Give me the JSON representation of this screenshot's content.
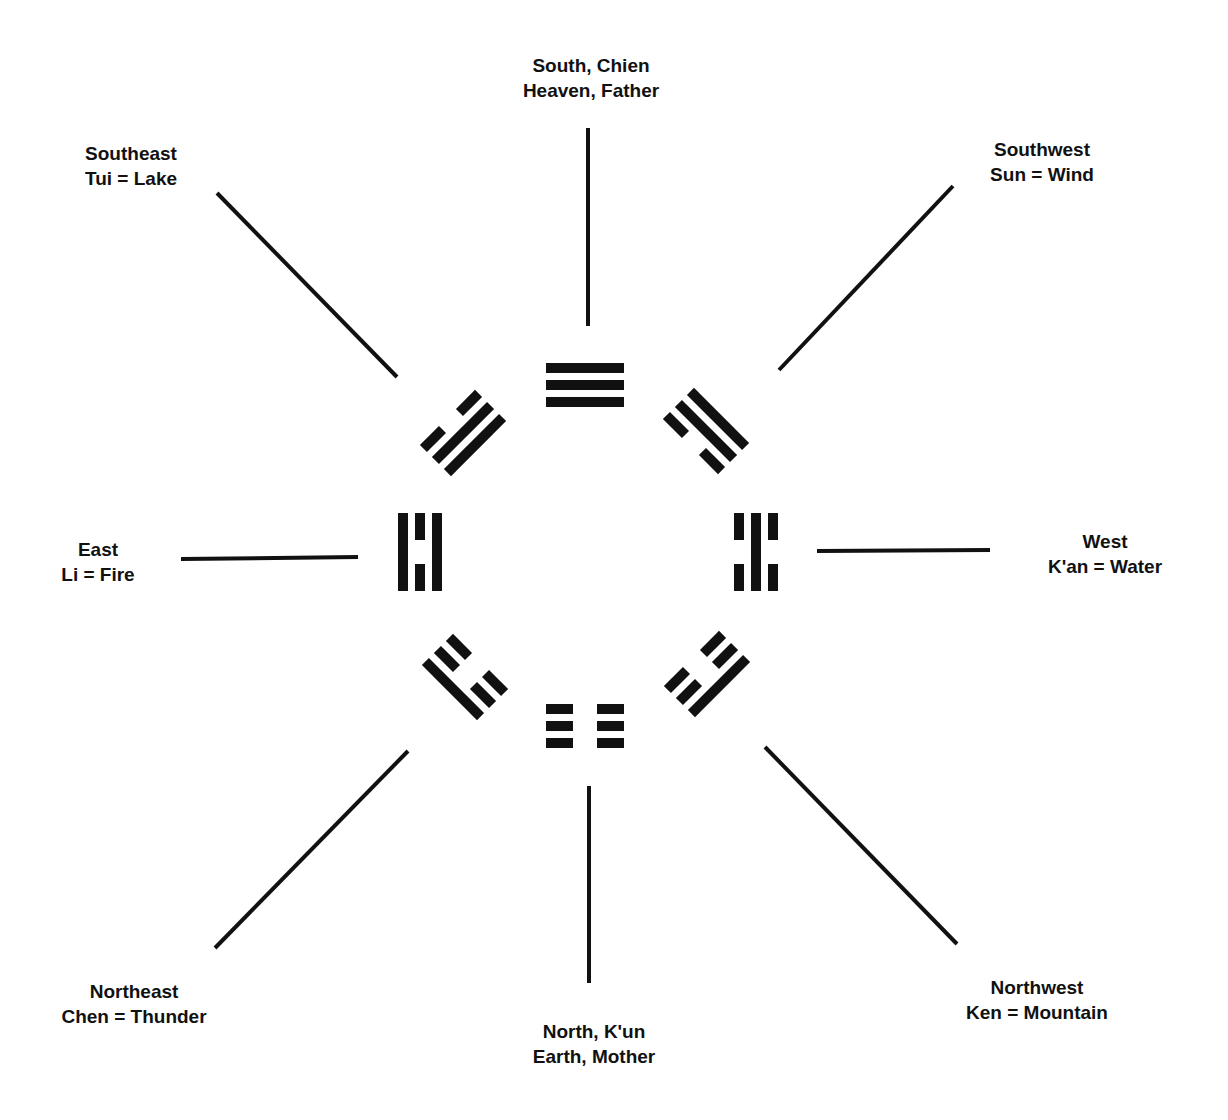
{
  "diagram": {
    "ink_color": "#111111",
    "background": "#ffffff",
    "directions": [
      {
        "id": "south",
        "line1": "South, Chien",
        "line2": "Heaven, Father",
        "label_pos": [
          591,
          53
        ],
        "connector": [
          588,
          128,
          588,
          326
        ],
        "trigram": {
          "center": [
            585,
            385
          ],
          "rotation": 0,
          "lines": [
            "solid",
            "solid",
            "solid"
          ]
        }
      },
      {
        "id": "southwest",
        "line1": "Southwest",
        "line2": "Sun = Wind",
        "label_pos": [
          1042,
          137
        ],
        "connector": [
          953,
          186,
          779,
          370
        ],
        "trigram": {
          "center": [
            706,
            431
          ],
          "rotation": 45,
          "lines": [
            "solid",
            "solid",
            "broken"
          ]
        }
      },
      {
        "id": "west",
        "line1": "West",
        "line2": "K'an = Water",
        "label_pos": [
          1105,
          529
        ],
        "connector": [
          817,
          551,
          990,
          550
        ],
        "trigram": {
          "center": [
            756,
            552
          ],
          "rotation": 90,
          "lines": [
            "broken",
            "solid",
            "broken"
          ]
        }
      },
      {
        "id": "northwest",
        "line1": "Northwest",
        "line2": "Ken = Mountain",
        "label_pos": [
          1037,
          975
        ],
        "connector": [
          765,
          747,
          957,
          944
        ],
        "trigram": {
          "center": [
            707,
            674
          ],
          "rotation": 135,
          "lines": [
            "solid",
            "broken",
            "broken"
          ]
        }
      },
      {
        "id": "north",
        "line1": "North, K'un",
        "line2": "Earth, Mother",
        "label_pos": [
          594,
          1019
        ],
        "connector": [
          589,
          786,
          589,
          983
        ],
        "trigram": {
          "center": [
            585,
            726
          ],
          "rotation": 0,
          "lines": [
            "broken",
            "broken",
            "broken"
          ]
        }
      },
      {
        "id": "northeast",
        "line1": "Northeast",
        "line2": "Chen = Thunder",
        "label_pos": [
          134,
          979
        ],
        "connector": [
          408,
          751,
          215,
          948
        ],
        "trigram": {
          "center": [
            465,
            677
          ],
          "rotation": 225,
          "lines": [
            "solid",
            "broken",
            "broken"
          ]
        }
      },
      {
        "id": "east",
        "line1": "East",
        "line2": "Li = Fire",
        "label_pos": [
          98,
          537
        ],
        "connector": [
          181,
          559,
          358,
          557
        ],
        "trigram": {
          "center": [
            420,
            552
          ],
          "rotation": 270,
          "lines": [
            "solid",
            "broken",
            "solid"
          ]
        }
      },
      {
        "id": "southeast",
        "line1": "Southeast",
        "line2": "Tui = Lake",
        "label_pos": [
          131,
          141
        ],
        "connector": [
          217,
          193,
          397,
          377
        ],
        "trigram": {
          "center": [
            463,
            433
          ],
          "rotation": 315,
          "lines": [
            "broken",
            "solid",
            "solid"
          ]
        }
      }
    ]
  }
}
